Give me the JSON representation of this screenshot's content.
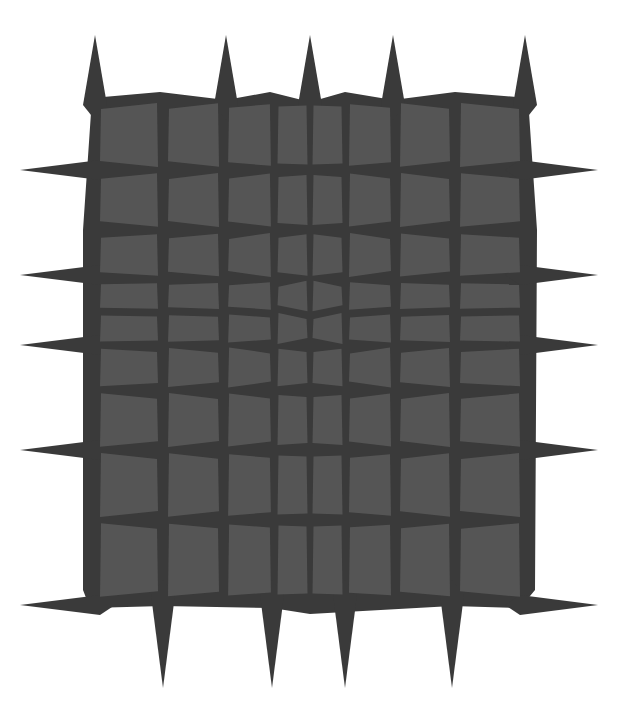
{
  "figure": {
    "colors": {
      "background": "#ffffff",
      "base": "#3a3a3a",
      "tile": "#555555"
    },
    "grid": {
      "columns_x": [
        95,
        163,
        224,
        275,
        310,
        345,
        395,
        455,
        525
      ],
      "rows_y": [
        100,
        170,
        230,
        280,
        312,
        345,
        390,
        450,
        520,
        600
      ]
    },
    "spikes": {
      "top_x": [
        95,
        226,
        310,
        393,
        525
      ],
      "top_tip_y": 35,
      "bottom_x": [
        163,
        272,
        345,
        452
      ],
      "bottom_tip_y": 688,
      "left_y": [
        170,
        275,
        345,
        450,
        605
      ],
      "left_tip_x": 20,
      "right_y": [
        170,
        275,
        345,
        450,
        605
      ],
      "right_tip_x": 598
    }
  }
}
